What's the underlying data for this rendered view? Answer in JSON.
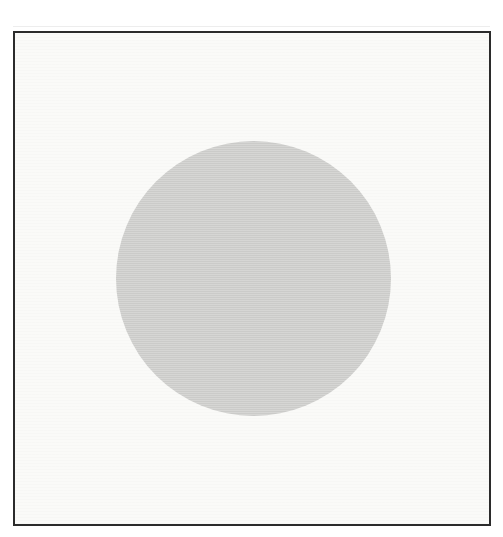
{
  "figure": {
    "elements": {
      "frame": "thin-dark-rectangular-border",
      "disc": "large-light-gray-filled-circle"
    }
  },
  "colors": {
    "page-bg": "#ffffff",
    "paper": "#fafaf8",
    "frame-line": "#2b2b2b",
    "disc": "#d4d4d2"
  }
}
